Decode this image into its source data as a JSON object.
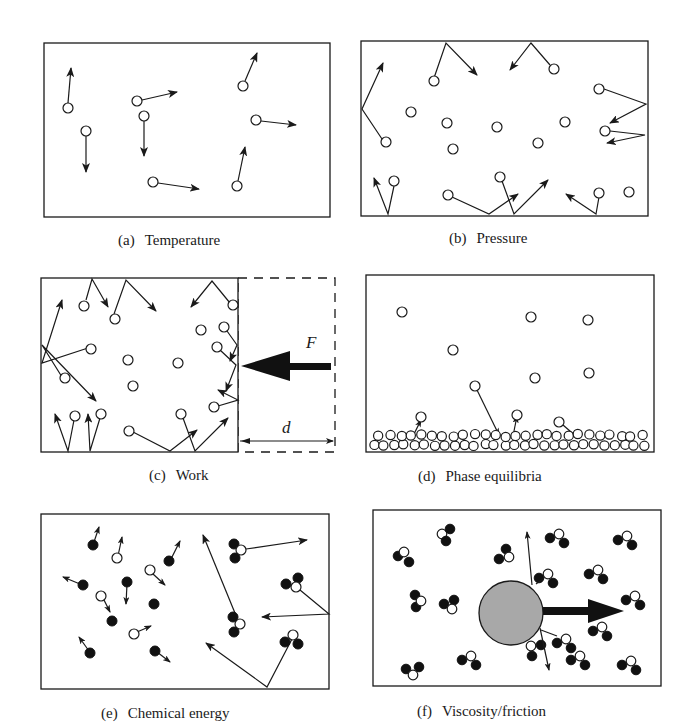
{
  "figure": {
    "panels": [
      {
        "id": "a",
        "label": "(a)",
        "title": "Temperature"
      },
      {
        "id": "b",
        "label": "(b)",
        "title": "Pressure"
      },
      {
        "id": "c",
        "label": "(c)",
        "title": "Work",
        "force_label": "F",
        "distance_label": "d"
      },
      {
        "id": "d",
        "label": "(d)",
        "title": "Phase equilibria"
      },
      {
        "id": "e",
        "label": "(e)",
        "title": "Chemical energy"
      },
      {
        "id": "f",
        "label": "(f)",
        "title": "Viscosity/friction"
      }
    ],
    "colors": {
      "line": "#1a1a1a",
      "sphere_fill": "#a8a8a8",
      "dark_atom": "#111111",
      "background": "#ffffff"
    }
  }
}
